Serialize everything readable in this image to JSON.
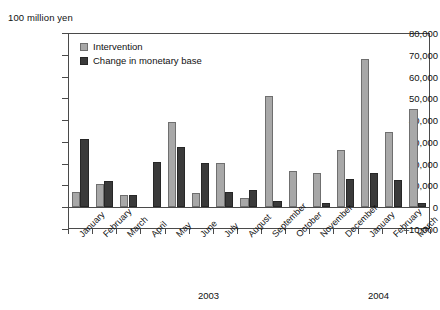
{
  "unit_caption": "100 million yen",
  "legend": {
    "position": "top-left-inside",
    "items": [
      {
        "label": "Intervention",
        "color": "#a8a8a8",
        "swatch": "intervention-swatch"
      },
      {
        "label": "Change in monetary base",
        "color": "#3a3a3a",
        "swatch": "monetary-swatch"
      }
    ]
  },
  "years": [
    {
      "label": "2003"
    },
    {
      "label": "2004"
    }
  ],
  "chart_data": {
    "type": "bar",
    "title": "",
    "subtitle": "",
    "xlabel": "",
    "ylabel": "100 million yen",
    "ylim": [
      -10000,
      80000
    ],
    "ytick_values": [
      -10000,
      0,
      10000,
      20000,
      30000,
      40000,
      50000,
      60000,
      70000,
      80000
    ],
    "ytick_labels": [
      "-10,000",
      "0",
      "10,000",
      "20,000",
      "30,000",
      "40,000",
      "50,000",
      "60,000",
      "70,000",
      "80,000"
    ],
    "grid": false,
    "legend_position": "upper left",
    "categories": [
      "January",
      "February",
      "March",
      "April",
      "May",
      "June",
      "July",
      "August",
      "September",
      "October",
      "November",
      "December",
      "January",
      "February",
      "March"
    ],
    "category_years": [
      "2003",
      "2003",
      "2003",
      "2003",
      "2003",
      "2003",
      "2003",
      "2003",
      "2003",
      "2003",
      "2003",
      "2003",
      "2004",
      "2004",
      "2004"
    ],
    "series": [
      {
        "name": "Intervention",
        "color": "#a8a8a8",
        "values": [
          6800,
          10500,
          5500,
          0,
          39000,
          6400,
          20500,
          4300,
          51000,
          16700,
          15800,
          26200,
          68000,
          34500,
          45000
        ]
      },
      {
        "name": "Change in monetary base",
        "color": "#3a3a3a",
        "values": [
          31400,
          12000,
          5500,
          20600,
          27800,
          20500,
          7200,
          8000,
          3000,
          0,
          2000,
          13000,
          15800,
          12300,
          2000
        ]
      }
    ]
  }
}
